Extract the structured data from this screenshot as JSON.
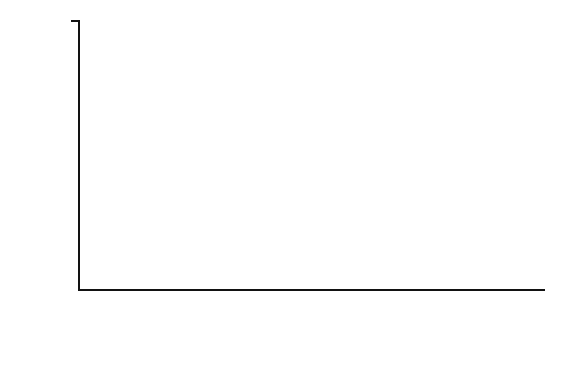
{
  "chart_data": {
    "type": "bar",
    "title": "",
    "subtitle": "",
    "xlabel": "",
    "ylabel": "Frequency",
    "ylim": [
      0,
      16
    ],
    "ytick_values": [
      0,
      2,
      4,
      6,
      8,
      10,
      12,
      14,
      16
    ],
    "ytick_labels": [
      "0",
      "2",
      "4",
      "6",
      "8",
      "10",
      "12",
      "14",
      "16"
    ],
    "grid": false,
    "legend": null,
    "bar_color": "#3c3c3c",
    "bar_edge_color": "#111111",
    "axis_color": "#121212",
    "background_color": "#ffffff",
    "categories": [
      "0.0–2.4",
      "2.5–4.9",
      "5.0–7.4",
      "7.5–9.9",
      "10.0–12.4",
      "12.5–14.9",
      "15.0–17.4",
      "17.5–19.9",
      "20.0–22.4",
      "22.5–24.9",
      "25.0–27.4",
      "27.5–29.9",
      "30.0–32.4",
      "32.5–34.9",
      "35.0–37.4",
      "37.5–39.9",
      "More"
    ],
    "values": [
      15,
      13,
      10,
      5,
      1,
      2,
      0,
      2,
      0,
      0,
      1,
      0,
      0,
      0,
      0,
      1,
      0
    ]
  }
}
